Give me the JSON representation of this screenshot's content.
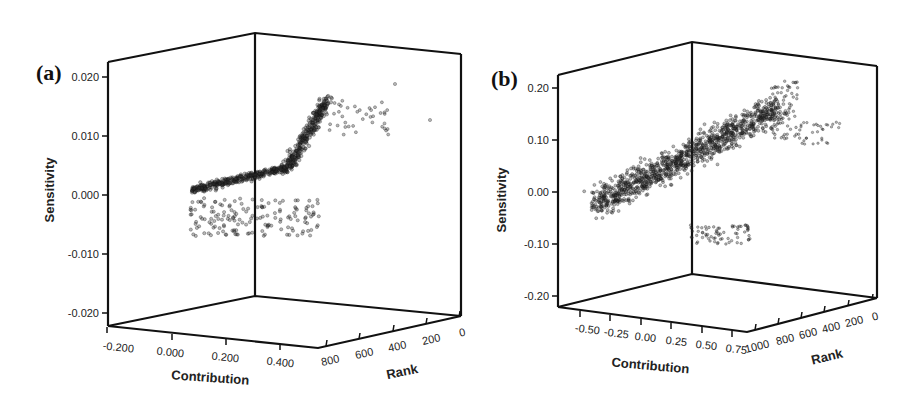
{
  "figure": {
    "panels": [
      {
        "id": "a",
        "label": "(a)"
      },
      {
        "id": "b",
        "label": "(b)"
      }
    ]
  },
  "chart_data": [
    {
      "type": "scatter",
      "panel": "(a)",
      "projection": "3d",
      "title": "",
      "xlabel": "Contribution",
      "ylabel": "Rank",
      "zlabel": "Sensitivity",
      "x_ticks": [
        "-0.200",
        "0.000",
        "0.200",
        "0.400"
      ],
      "y_ticks": [
        "800",
        "600",
        "400",
        "200",
        "0"
      ],
      "z_ticks": [
        "0.020",
        "0.010",
        "0.000",
        "-0.010",
        "-0.020"
      ],
      "xlim": [
        -0.25,
        0.5
      ],
      "ylim": [
        850,
        0
      ],
      "zlim": [
        -0.022,
        0.022
      ],
      "grid": false,
      "description": "Dense cloud of ~800 points; sensitivity near 0 for low contribution, rising sharply to ~0.015 for high contribution / top ranks, with a spread of negative-sensitivity points down to about -0.007",
      "clusters": [
        {
          "contribution_range": [
            -0.2,
            0.1
          ],
          "sensitivity_range": [
            -0.002,
            0.003
          ],
          "density": "high"
        },
        {
          "contribution_range": [
            0.1,
            0.35
          ],
          "sensitivity_range": [
            0.002,
            0.016
          ],
          "density": "high"
        },
        {
          "contribution_range": [
            0.0,
            0.35
          ],
          "sensitivity_range": [
            -0.007,
            0.0
          ],
          "density": "medium"
        },
        {
          "contribution_range": [
            0.35,
            0.5
          ],
          "sensitivity_range": [
            0.008,
            0.018
          ],
          "density": "low"
        }
      ]
    },
    {
      "type": "scatter",
      "panel": "(b)",
      "projection": "3d",
      "title": "",
      "xlabel": "Contribution",
      "ylabel": "Rank",
      "zlabel": "Sensitivity",
      "x_ticks": [
        "-0.50",
        "-0.25",
        "0.00",
        "0.25",
        "0.50",
        "0.75"
      ],
      "y_ticks": [
        "1000",
        "800",
        "600",
        "400",
        "200",
        "0"
      ],
      "z_ticks": [
        "0.20",
        "0.10",
        "0.00",
        "-0.10",
        "-0.20"
      ],
      "xlim": [
        -0.6,
        0.85
      ],
      "ylim": [
        1050,
        0
      ],
      "zlim": [
        -0.22,
        0.22
      ],
      "grid": false,
      "description": "Dense cloud of ~1000 points; sensitivity around 0 for low contribution rising to ~0.2 for high contribution / top ranks, with spread down to about -0.08",
      "clusters": [
        {
          "contribution_range": [
            -0.5,
            0.0
          ],
          "sensitivity_range": [
            -0.04,
            0.03
          ],
          "density": "medium"
        },
        {
          "contribution_range": [
            0.0,
            0.5
          ],
          "sensitivity_range": [
            -0.08,
            0.12
          ],
          "density": "high"
        },
        {
          "contribution_range": [
            0.4,
            0.75
          ],
          "sensitivity_range": [
            0.12,
            0.21
          ],
          "density": "low"
        }
      ]
    }
  ]
}
